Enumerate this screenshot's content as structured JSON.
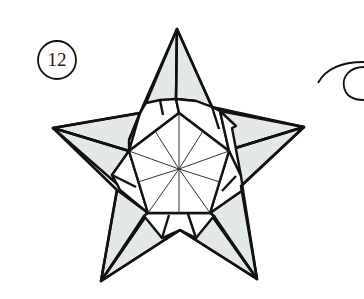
{
  "diagram": {
    "type": "origami-instruction-step",
    "step_number": "12",
    "colors": {
      "line": "#111111",
      "paper_colored_side": "#e2e9e6",
      "paper_white_side": "#ffffff",
      "thin_crease": "#333333"
    },
    "elements": [
      {
        "name": "step-number-circle",
        "label": "12"
      },
      {
        "name": "star-outline",
        "points": 5
      },
      {
        "name": "center-pentagon",
        "radial_creases": 10
      },
      {
        "name": "turn-over-arrow",
        "position": "right edge, partially cropped"
      }
    ]
  }
}
